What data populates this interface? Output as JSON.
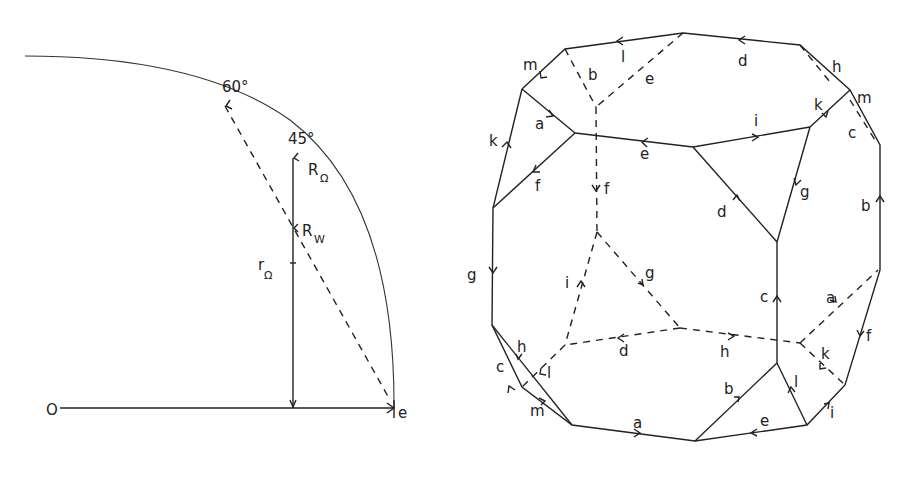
{
  "left_figure": {
    "origin_label": "O",
    "end_label": "e",
    "angle_60": "60°",
    "angle_45": "45°",
    "r_omega_big": "R",
    "r_omega_big_sub": "Ω",
    "r_w": "R",
    "r_w_sub": "W",
    "r_omega_small": "r",
    "r_omega_small_sub": "Ω"
  },
  "right_figure": {
    "description": "Truncated-cube polyhedron with labeled directed edges",
    "edge_labels": {
      "top_l": "l",
      "top_d": "d",
      "top_h": "h",
      "top_m_right": "m",
      "top_m_left": "m",
      "top_b_hidden": "b",
      "top_e_hidden": "e",
      "upper_a": "a",
      "upper_k_left": "k",
      "upper_f": "f",
      "upper_e": "e",
      "upper_i": "i",
      "upper_k_right": "k",
      "upper_c": "c",
      "hidden_f": "f",
      "mid_d": "d",
      "mid_g_right": "g",
      "right_b": "b",
      "left_g": "g",
      "hidden_i": "i",
      "hidden_g": "g",
      "mid_c": "c",
      "hidden_a": "a",
      "right_f": "f",
      "hidden_d": "d",
      "hidden_h": "h",
      "hidden_k": "k",
      "bottom_h": "h",
      "bottom_c": "c",
      "bottom_l_left": "l",
      "bottom_m": "m",
      "bottom_a": "a",
      "bottom_b": "b",
      "bottom_l_right": "l",
      "bottom_e": "e",
      "bottom_i": "i"
    }
  }
}
